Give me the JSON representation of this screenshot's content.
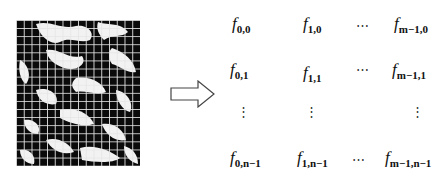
{
  "figure": {
    "image": {
      "description": "binarized terrain/texture image overlaid with a regular grid",
      "grid_columns": 16,
      "grid_rows": 18
    },
    "arrow": {
      "direction": "right",
      "style": "hollow-outline"
    },
    "matrix": {
      "rows": [
        {
          "c0": {
            "base": "f",
            "sub": "0,0"
          },
          "c1": {
            "base": "f",
            "sub": "1,0"
          },
          "c2": "⋯",
          "c3": {
            "base": "f",
            "sub": "m−1,0"
          }
        },
        {
          "c0": {
            "base": "f",
            "sub": "0,1"
          },
          "c1": {
            "base": "f",
            "sub": "1,1"
          },
          "c2": "⋯",
          "c3": {
            "base": "f",
            "sub": "m−1,1"
          }
        },
        {
          "c0": "⋮",
          "c1": "⋮",
          "c2": "",
          "c3": "⋮"
        },
        {
          "c0": {
            "base": "f",
            "sub": "0,n−1"
          },
          "c1": {
            "base": "f",
            "sub": "1,n−1"
          },
          "c2": "⋯",
          "c3": {
            "base": "f",
            "sub": "m−1,n−1"
          }
        }
      ]
    }
  }
}
